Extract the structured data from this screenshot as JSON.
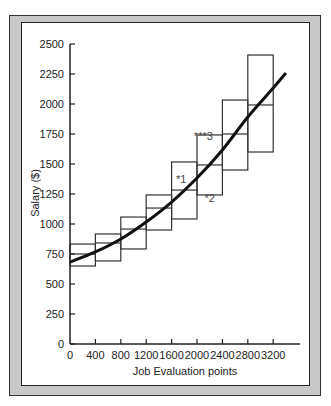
{
  "chart_data": {
    "type": "line",
    "title": "",
    "xlabel": "Job Evaluation points",
    "ylabel": "Salary ($)",
    "xlim": [
      0,
      3500
    ],
    "ylim": [
      0,
      2500
    ],
    "x_ticks": [
      "0",
      "400",
      "800",
      "1200",
      "1600",
      "2000",
      "2400",
      "2800",
      "3200"
    ],
    "y_ticks": [
      "0",
      "250",
      "500",
      "750",
      "1000",
      "1250",
      "1500",
      "1750",
      "2000",
      "2250",
      "2500"
    ],
    "grid": false,
    "legend": null,
    "series": [
      {
        "name": "Salary trend line",
        "type": "line",
        "x": [
          0,
          400,
          800,
          1200,
          1600,
          2000,
          2400,
          2800,
          3200,
          3400
        ],
        "y": [
          683,
          767,
          875,
          1017,
          1183,
          1383,
          1617,
          1892,
          2133,
          2258
        ]
      }
    ],
    "pay_grades": [
      {
        "x_start": 0,
        "x_end": 400,
        "max": 833,
        "mid": 750,
        "min": 650
      },
      {
        "x_start": 400,
        "x_end": 800,
        "max": 917,
        "mid": 842,
        "min": 692
      },
      {
        "x_start": 800,
        "x_end": 1200,
        "max": 1058,
        "mid": 958,
        "min": 792
      },
      {
        "x_start": 1200,
        "x_end": 1600,
        "max": 1242,
        "mid": 1133,
        "min": 950
      },
      {
        "x_start": 1600,
        "x_end": 2000,
        "max": 1517,
        "mid": 1283,
        "min": 1042
      },
      {
        "x_start": 2000,
        "x_end": 2400,
        "max": 1742,
        "mid": 1492,
        "min": 1242
      },
      {
        "x_start": 2400,
        "x_end": 2800,
        "max": 2033,
        "mid": 1750,
        "min": 1450
      },
      {
        "x_start": 2800,
        "x_end": 3200,
        "max": 2408,
        "mid": 1992,
        "min": 1600
      }
    ],
    "annotations": [
      {
        "text": "*1",
        "x": 1750,
        "y": 1340
      },
      {
        "text": "*2",
        "x": 2200,
        "y": 1180
      },
      {
        "text": "***3",
        "x": 2100,
        "y": 1700
      }
    ]
  }
}
